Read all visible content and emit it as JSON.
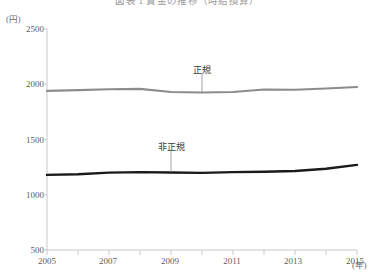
{
  "chart_data": {
    "type": "line",
    "title": "図表 1 賃金の推移（時給換算）",
    "ylabel": "(円)",
    "xlabel": "(年)",
    "x": [
      2005,
      2006,
      2007,
      2008,
      2009,
      2010,
      2011,
      2012,
      2013,
      2014,
      2015
    ],
    "xlim": [
      2005,
      2015
    ],
    "ylim": [
      500,
      2500
    ],
    "yticks": [
      500,
      1000,
      1500,
      2000,
      2500
    ],
    "xticks": [
      2005,
      2006,
      2007,
      2008,
      2009,
      2010,
      2011,
      2012,
      2013,
      2014,
      2015
    ],
    "xtick_labels_shown": [
      2005,
      2007,
      2009,
      2011,
      2013,
      2015
    ],
    "grid": false,
    "legend_position": "inline-annotation",
    "series": [
      {
        "name": "正規",
        "color": "#8c8c8c",
        "values": [
          1940,
          1947,
          1955,
          1958,
          1930,
          1925,
          1930,
          1952,
          1950,
          1962,
          1975
        ]
      },
      {
        "name": "非正規",
        "color": "#1a1a1a",
        "values": [
          1180,
          1185,
          1200,
          1205,
          1202,
          1198,
          1205,
          1208,
          1215,
          1235,
          1270
        ]
      }
    ],
    "annotations": [
      {
        "text": "正規",
        "x": 2010,
        "y": 2130,
        "leader_to_y": 1928
      },
      {
        "text": "非正規",
        "x": 2009,
        "y": 1430,
        "leader_to_y": 1205
      }
    ]
  },
  "axis": {
    "y_unit": "(円)",
    "x_unit": "(年)",
    "y_tick_labels": [
      "2500",
      "2000",
      "1500",
      "1000",
      "500"
    ],
    "x_tick_labels": [
      "2005",
      "2007",
      "2009",
      "2011",
      "2013",
      "2015"
    ]
  },
  "colors": {
    "regular_line": "#8c8c8c",
    "nonregular_line": "#1a1a1a",
    "axis": "#c9c9c9",
    "text": "#5d5d5d"
  }
}
